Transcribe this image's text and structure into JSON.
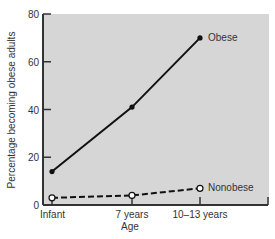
{
  "chart_data": {
    "type": "line",
    "title": "",
    "xlabel": "Age",
    "ylabel": "Percentage becoming obese adults",
    "categories": [
      "Infant",
      "7 years",
      "10–13 years"
    ],
    "ylim": [
      0,
      80
    ],
    "yticks": [
      0,
      20,
      40,
      60,
      80
    ],
    "grid": false,
    "legend": "inline labels at line ends",
    "series": [
      {
        "name": "Obese",
        "values": [
          14,
          41,
          70
        ],
        "line_style": "solid",
        "marker": "filled-circle",
        "color": "#111111"
      },
      {
        "name": "Nonobese",
        "values": [
          3,
          4,
          7
        ],
        "line_style": "dashed",
        "marker": "open-circle",
        "color": "#111111"
      }
    ]
  },
  "colors": {
    "plot_background": "#d6d6d6",
    "axis": "#333333",
    "line": "#111111"
  }
}
